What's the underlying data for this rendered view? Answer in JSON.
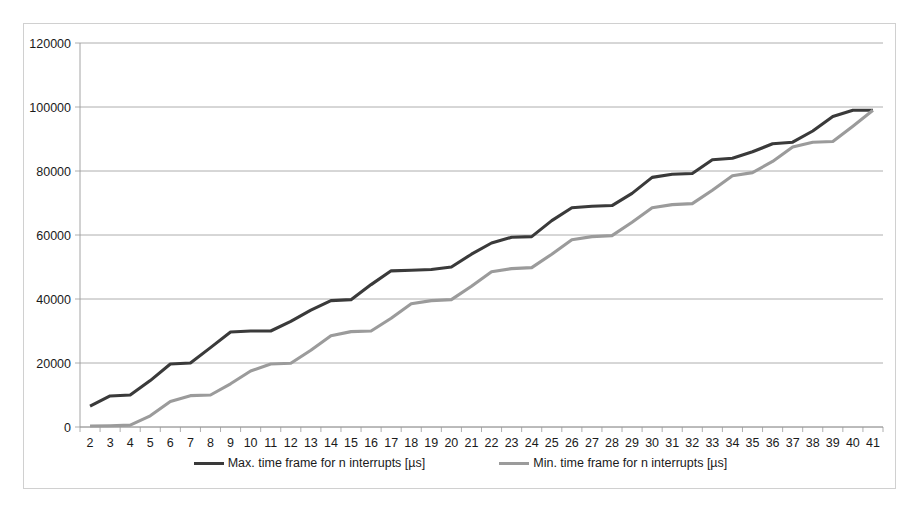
{
  "chart_data": {
    "type": "line",
    "title": "",
    "xlabel": "",
    "ylabel": "",
    "grid": true,
    "legend_position": "bottom",
    "ylim": [
      0,
      120000
    ],
    "ytick_labels": [
      "0",
      "20000",
      "40000",
      "60000",
      "80000",
      "100000",
      "120000"
    ],
    "yticks": [
      0,
      20000,
      40000,
      60000,
      80000,
      100000,
      120000
    ],
    "categories": [
      2,
      3,
      4,
      5,
      6,
      7,
      8,
      9,
      10,
      11,
      12,
      13,
      14,
      15,
      16,
      17,
      18,
      19,
      20,
      21,
      22,
      23,
      24,
      25,
      26,
      27,
      28,
      29,
      30,
      31,
      32,
      33,
      34,
      35,
      36,
      37,
      38,
      39,
      40,
      41
    ],
    "xtick_labels": [
      "2",
      "3",
      "4",
      "5",
      "6",
      "7",
      "8",
      "9",
      "10",
      "11",
      "12",
      "13",
      "14",
      "15",
      "16",
      "17",
      "18",
      "19",
      "20",
      "21",
      "22",
      "23",
      "24",
      "25",
      "26",
      "27",
      "28",
      "29",
      "30",
      "31",
      "32",
      "33",
      "34",
      "35",
      "36",
      "37",
      "38",
      "39",
      "40",
      "41"
    ],
    "series": [
      {
        "name": "Max. time frame for n interrupts [µs]",
        "color": "#3a3a3a",
        "values": [
          6500,
          9700,
          10000,
          14500,
          19700,
          20000,
          24800,
          29700,
          30000,
          30000,
          33000,
          36500,
          39500,
          39800,
          44500,
          48800,
          49000,
          49200,
          50000,
          54000,
          57500,
          59300,
          59500,
          64500,
          68500,
          69000,
          69200,
          73000,
          78000,
          79000,
          79200,
          83500,
          84000,
          86000,
          88500,
          89000,
          92500,
          97000,
          99000,
          99000
        ]
      },
      {
        "name": "Min. time frame for n interrupts [µs]",
        "color": "#9b9b9b",
        "values": [
          300,
          400,
          600,
          3500,
          8000,
          9800,
          10000,
          13500,
          17500,
          19700,
          19900,
          24000,
          28500,
          29800,
          30000,
          34000,
          38500,
          39500,
          39800,
          44000,
          48500,
          49500,
          49800,
          54000,
          58500,
          59500,
          59800,
          64000,
          68500,
          69500,
          69800,
          74000,
          78500,
          79500,
          83000,
          87500,
          89000,
          89200,
          94000,
          99000
        ]
      }
    ]
  },
  "legend": {
    "entries": [
      {
        "label": "Max. time frame for n interrupts [µs]"
      },
      {
        "label": "Min. time frame for n interrupts [µs]"
      }
    ]
  }
}
